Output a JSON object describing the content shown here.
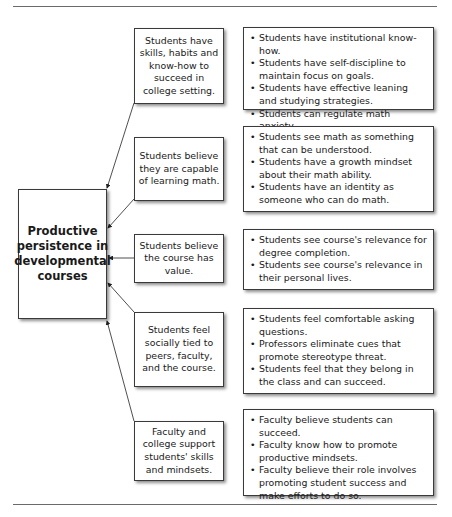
{
  "diagram": {
    "central_node": {
      "label": "Productive persistence in developmental courses"
    },
    "factors": [
      {
        "label": "Students have skills, habits and know-how to succeed in college setting.",
        "details": [
          "Students have institutional know-how.",
          "Students have self-discipline to maintain focus on goals.",
          "Students have effective leaning and studying strategies.",
          "Students can regulate math anxiety."
        ]
      },
      {
        "label": "Students believe they are capable of learning math.",
        "details": [
          "Students see math as something that can be understood.",
          "Students have a growth mindset about their math ability.",
          "Students have an identity as someone who can do math."
        ]
      },
      {
        "label": "Students believe the course has value.",
        "details": [
          "Students see course's relevance for degree completion.",
          "Students see course's relevance in their personal lives."
        ]
      },
      {
        "label": "Students feel socially tied to peers, faculty, and the course.",
        "details": [
          "Students feel comfortable asking questions.",
          "Professors eliminate cues that promote stereotype threat.",
          "Students feel that they belong in the class and can succeed."
        ]
      },
      {
        "label": "Faculty and college support students' skills and mindsets.",
        "details": [
          "Faculty believe students can succeed.",
          "Faculty know how to promote productive mindsets.",
          "Faculty believe their role involves promoting student success and make efforts to do so."
        ]
      }
    ],
    "colors": {
      "border": "#3a3a3a",
      "text": "#1a1a1a",
      "rule": "#6a6a6a"
    }
  }
}
